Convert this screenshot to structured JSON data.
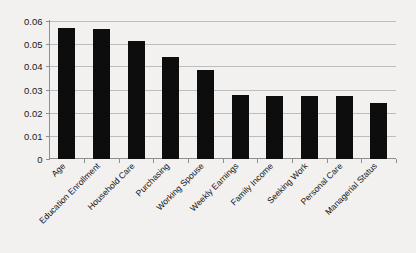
{
  "chart_data": {
    "type": "bar",
    "title": "",
    "subtitle": "",
    "xlabel": "",
    "ylabel": "",
    "ylim": [
      0,
      0.06
    ],
    "ytick_labels": [
      "0.06",
      "0.05",
      "0.04",
      "0.03",
      "0.02",
      "0.01",
      "0"
    ],
    "ytick_values": [
      0.06,
      0.05,
      0.04,
      0.03,
      0.02,
      0.01,
      0
    ],
    "grid": true,
    "legend": null,
    "legend_position": "none",
    "bar_color": "#0d0d0d",
    "gridline_color": "#bdbdbd",
    "background_color": "#f2f1ef",
    "categories": [
      "Age",
      "Education Enrollment",
      "Household Care",
      "Purchasing",
      "Working Spouse",
      "Weekly Earnings",
      "Family Income",
      "Seeking Work",
      "Personal Care",
      "Managerial Status"
    ],
    "values": [
      0.0567,
      0.0564,
      0.0513,
      0.0443,
      0.0383,
      0.0274,
      0.0273,
      0.0273,
      0.0273,
      0.0243
    ],
    "label_rotation_deg": -45
  }
}
